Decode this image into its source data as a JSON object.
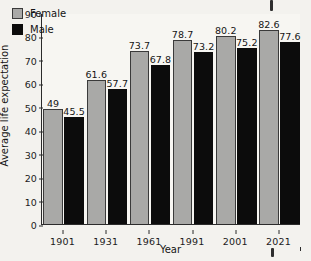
{
  "chart_data": {
    "type": "bar",
    "title": "",
    "xlabel": "Year",
    "ylabel": "Average life expectation",
    "categories": [
      "1901",
      "1931",
      "1961",
      "1991",
      "2001",
      "2021"
    ],
    "series": [
      {
        "name": "Female",
        "color": "#a9a9a7",
        "values": [
          49,
          61.6,
          73.7,
          78.7,
          80.2,
          82.6
        ],
        "labels": [
          "49",
          "61.6",
          "73.7",
          "78.7",
          "80.2",
          "82.6"
        ]
      },
      {
        "name": "Male",
        "color": "#0c0c0c",
        "values": [
          45.5,
          57.7,
          67.8,
          73.2,
          75.2,
          77.6
        ],
        "labels": [
          "45.5",
          "57.7",
          "67.8",
          "73.2",
          "75.2",
          "77.6"
        ]
      }
    ],
    "ylim": [
      0,
      90
    ],
    "ytick_step": 10,
    "yticks": [
      "0",
      "10",
      "20",
      "30",
      "40",
      "50",
      "60",
      "70",
      "80",
      "90"
    ],
    "grid": false,
    "legend_position": "top-left"
  },
  "legend": {
    "entries": [
      {
        "label": "Female",
        "swatch": "female-swatch"
      },
      {
        "label": "Male",
        "swatch": "male-swatch"
      }
    ]
  },
  "artifacts": {
    "top_mark": "",
    "bottom_mark": ""
  }
}
